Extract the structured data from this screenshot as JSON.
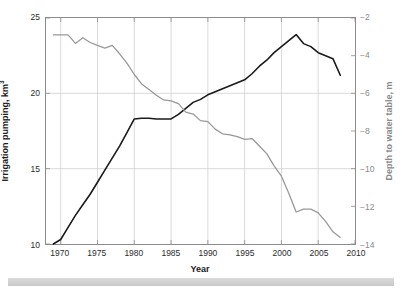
{
  "chart_data": {
    "type": "line",
    "title": "",
    "xlabel": "Year",
    "ylabel": "Irrigation pumping, km³",
    "ylabel_right": "Depth to water table, m",
    "xlim": [
      1968,
      2010
    ],
    "ylim": [
      10,
      25
    ],
    "ylim_right": [
      -14,
      -2
    ],
    "xticks": [
      1970,
      1975,
      1980,
      1985,
      1990,
      1995,
      2000,
      2005,
      2010
    ],
    "xticklabels": [
      "1970",
      "1975",
      "1980",
      "1985",
      "1990",
      "1995",
      "2000",
      "2005",
      "2010"
    ],
    "yticks": [
      10,
      15,
      20,
      25
    ],
    "yticklabels": [
      "10",
      "15",
      "20",
      "25"
    ],
    "yticks_right": [
      -14,
      -12,
      -10,
      -8,
      -6,
      -4,
      -2
    ],
    "yticklabels_right": [
      "−14",
      "−12",
      "−10",
      "−8",
      "−6",
      "−4",
      "−2"
    ],
    "grid": true,
    "legend": "none",
    "series": [
      {
        "name": "Irrigation pumping",
        "axis": "left",
        "color": "#1a1a1a",
        "linewidth": 1.6,
        "units": "km³",
        "x": [
          1969,
          1970,
          1971,
          1972,
          1973,
          1974,
          1975,
          1976,
          1977,
          1978,
          1979,
          1980,
          1981,
          1982,
          1983,
          1984,
          1985,
          1986,
          1987,
          1988,
          1989,
          1990,
          1991,
          1992,
          1993,
          1994,
          1995,
          1996,
          1997,
          1998,
          1999,
          2000,
          2001,
          2002,
          2003,
          2004,
          2005,
          2006,
          2007,
          2008
        ],
        "y": [
          10.0,
          10.3,
          11.1,
          11.9,
          12.6,
          13.3,
          14.1,
          14.9,
          15.7,
          16.5,
          17.4,
          18.3,
          18.35,
          18.35,
          18.3,
          18.3,
          18.3,
          18.6,
          19.0,
          19.4,
          19.6,
          19.9,
          20.1,
          20.3,
          20.5,
          20.7,
          20.9,
          21.3,
          21.8,
          22.2,
          22.7,
          23.1,
          23.5,
          23.9,
          23.3,
          23.1,
          22.7,
          22.5,
          22.3,
          21.2
        ]
      },
      {
        "name": "Depth to water table",
        "axis": "right",
        "color": "#999999",
        "linewidth": 1.3,
        "units": "m",
        "x": [
          1969,
          1970,
          1971,
          1972,
          1973,
          1974,
          1975,
          1976,
          1977,
          1978,
          1979,
          1980,
          1981,
          1982,
          1983,
          1984,
          1985,
          1986,
          1987,
          1988,
          1989,
          1990,
          1991,
          1992,
          1993,
          1994,
          1995,
          1996,
          1997,
          1998,
          1999,
          2000,
          2001,
          2002,
          2003,
          2004,
          2005,
          2006,
          2007,
          2008
        ],
        "y": [
          -2.9,
          -2.9,
          -2.9,
          -3.35,
          -3.05,
          -3.3,
          -3.45,
          -3.6,
          -3.45,
          -3.9,
          -4.4,
          -5.0,
          -5.5,
          -5.8,
          -6.1,
          -6.35,
          -6.4,
          -6.55,
          -7.0,
          -7.1,
          -7.45,
          -7.5,
          -7.9,
          -8.15,
          -8.2,
          -8.3,
          -8.45,
          -8.4,
          -8.8,
          -9.2,
          -9.85,
          -10.4,
          -11.3,
          -12.3,
          -12.15,
          -12.15,
          -12.35,
          -12.8,
          -13.35,
          -13.65
        ]
      }
    ]
  },
  "axes": {
    "frame_color": "#8c8c8c",
    "grid_color": "#d0d0d0",
    "left_tick_color": "#2b2b2b",
    "right_tick_color": "#8a8a8a"
  },
  "decor": {
    "bottom_bar_color": "#d4d4d4"
  }
}
